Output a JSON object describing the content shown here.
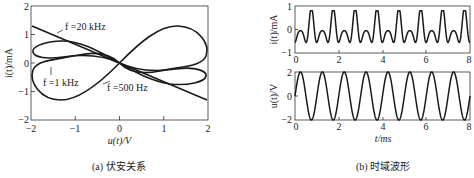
{
  "chart_data": [
    {
      "type": "line",
      "title": "",
      "caption": "(a) 伏安关系",
      "xlabel": "u(t)/V",
      "ylabel": "i(t)/mA",
      "xlim": [
        -2,
        2
      ],
      "ylim": [
        -2,
        2
      ],
      "xticks": [
        -2,
        -1,
        0,
        1,
        2
      ],
      "yticks": [
        -2,
        -1,
        0,
        1,
        2
      ],
      "grid": false,
      "annotations": [
        "f=20 kHz",
        "f=1 kHz",
        "f=500 Hz"
      ],
      "series": [
        {
          "name": "f=500 Hz",
          "shape": "pinched hysteresis lobe, amplitude ~1.35 mA at u=±1.6 V",
          "x": [
            -2,
            -1.6,
            -1,
            0,
            1,
            1.6,
            2
          ],
          "y": [
            -0.3,
            -1.35,
            -1.0,
            0,
            1.0,
            1.35,
            0.3
          ]
        },
        {
          "name": "f=1 kHz",
          "shape": "narrower pinched loop, ~0.8 mA at u=±1.7 V",
          "x": [
            -2,
            -1.5,
            -1,
            0,
            1,
            1.5,
            2
          ],
          "y": [
            0.6,
            0.8,
            0.65,
            0,
            -0.65,
            -0.8,
            -0.6
          ]
        },
        {
          "name": "f=20 kHz",
          "shape": "nearly linear, negative slope",
          "x": [
            -2,
            0,
            2
          ],
          "y": [
            1.3,
            0,
            -1.3
          ]
        }
      ]
    },
    {
      "type": "line",
      "caption": "(b) 时域波形",
      "xlabel": "t/ms",
      "ylabel": "i(t)/mA",
      "xlim": [
        0,
        8
      ],
      "ylim": [
        -1,
        1
      ],
      "xticks": [
        0,
        2,
        4,
        6,
        8
      ],
      "yticks": [
        -1,
        0,
        1
      ],
      "series": [
        {
          "name": "i(t)",
          "description": "periodic, period 1 ms, peaks ~0.75 mA, troughs ~-0.75 mA, secondary bumps ~0.2 mA"
        }
      ]
    },
    {
      "type": "line",
      "xlabel": "t/ms",
      "ylabel": "u(t)/V",
      "xlim": [
        0,
        8
      ],
      "ylim": [
        -2,
        2
      ],
      "xticks": [
        0,
        2,
        4,
        6,
        8
      ],
      "yticks": [
        -2,
        0,
        2
      ],
      "series": [
        {
          "name": "u(t)",
          "description": "sinusoid amplitude 2 V, frequency 1 kHz (period 1 ms)"
        }
      ]
    }
  ],
  "labels": {
    "a_xlabel": "u(t)/V",
    "a_ylabel": "i(t)/mA",
    "a_caption": "(a) 伏安关系",
    "b_caption": "(b) 时域波形",
    "b_xlabel": "t/ms",
    "b_ylabel_top": "i(t)/mA",
    "b_ylabel_bottom": "u(t)/V",
    "ann_20k": "f =20 kHz",
    "ann_1k": "f =1 kHz",
    "ann_500": "f =500 Hz"
  },
  "ticks": {
    "a_x": [
      "−2",
      "−1",
      "0",
      "1",
      "2"
    ],
    "a_y": [
      "2",
      "1",
      "0",
      "−1",
      "−2"
    ],
    "b_x": [
      "0",
      "2",
      "4",
      "6",
      "8"
    ],
    "b_top_y": [
      "1",
      "0",
      "−1"
    ],
    "b_bot_y": [
      "2",
      "0",
      "−2"
    ]
  }
}
